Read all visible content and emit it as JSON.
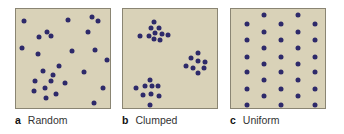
{
  "figure": {
    "panels": [
      {
        "letter": "a",
        "label": "Random",
        "left": 15,
        "dots": [
          [
            8,
            12
          ],
          [
            52,
            11
          ],
          [
            76,
            8
          ],
          [
            82,
            12
          ],
          [
            31,
            23
          ],
          [
            23,
            28
          ],
          [
            72,
            23
          ],
          [
            35,
            27
          ],
          [
            6,
            39
          ],
          [
            22,
            45
          ],
          [
            56,
            42
          ],
          [
            79,
            41
          ],
          [
            91,
            51
          ],
          [
            43,
            57
          ],
          [
            27,
            62
          ],
          [
            68,
            63
          ],
          [
            37,
            66
          ],
          [
            19,
            72
          ],
          [
            35,
            72
          ],
          [
            49,
            74
          ],
          [
            29,
            79
          ],
          [
            18,
            82
          ],
          [
            40,
            85
          ],
          [
            87,
            79
          ],
          [
            30,
            89
          ],
          [
            78,
            94
          ]
        ]
      },
      {
        "letter": "b",
        "label": "Clumped",
        "left": 122,
        "dots": [
          [
            31,
            13
          ],
          [
            28,
            19
          ],
          [
            36,
            19
          ],
          [
            32,
            24
          ],
          [
            39,
            25
          ],
          [
            26,
            27
          ],
          [
            31,
            30
          ],
          [
            37,
            31
          ],
          [
            17,
            27
          ],
          [
            45,
            26
          ],
          [
            75,
            44
          ],
          [
            68,
            49
          ],
          [
            75,
            52
          ],
          [
            82,
            53
          ],
          [
            63,
            57
          ],
          [
            70,
            59
          ],
          [
            81,
            59
          ],
          [
            75,
            64
          ],
          [
            27,
            71
          ],
          [
            22,
            77
          ],
          [
            29,
            77
          ],
          [
            35,
            77
          ],
          [
            13,
            79
          ],
          [
            20,
            86
          ],
          [
            28,
            85
          ],
          [
            36,
            87
          ],
          [
            27,
            96
          ]
        ]
      },
      {
        "letter": "c",
        "label": "Uniform",
        "left": 230,
        "dots": [
          [
            33,
            6
          ],
          [
            67,
            6
          ],
          [
            16,
            15
          ],
          [
            50,
            15
          ],
          [
            84,
            15
          ],
          [
            33,
            23
          ],
          [
            67,
            23
          ],
          [
            16,
            31
          ],
          [
            50,
            31
          ],
          [
            84,
            31
          ],
          [
            33,
            39
          ],
          [
            67,
            39
          ],
          [
            16,
            48
          ],
          [
            50,
            48
          ],
          [
            84,
            48
          ],
          [
            33,
            55
          ],
          [
            67,
            55
          ],
          [
            16,
            63
          ],
          [
            50,
            63
          ],
          [
            84,
            63
          ],
          [
            33,
            71
          ],
          [
            67,
            71
          ],
          [
            16,
            80
          ],
          [
            50,
            80
          ],
          [
            84,
            80
          ],
          [
            33,
            87
          ],
          [
            67,
            87
          ],
          [
            16,
            96
          ],
          [
            50,
            96
          ],
          [
            84,
            96
          ]
        ]
      }
    ],
    "colors": {
      "panel_fill": "#d9d2b8",
      "panel_border": "#8a8573",
      "dot": "#2e2a6a"
    }
  }
}
